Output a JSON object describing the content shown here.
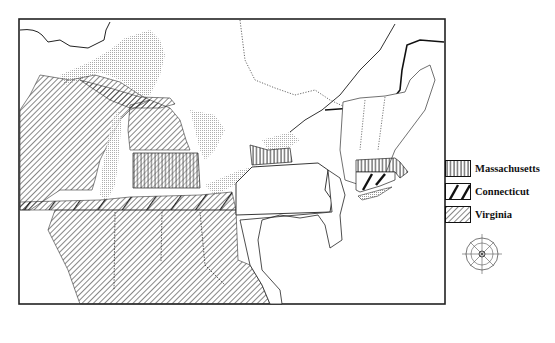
{
  "map": {
    "title": "",
    "region": "Great Lakes and Northeastern United States",
    "compass": {
      "visible": true,
      "position": [
        482,
        254
      ]
    }
  },
  "legend": {
    "items": [
      {
        "label": "Massachusetts",
        "pattern": "vertical-lines"
      },
      {
        "label": "Connecticut",
        "pattern": "wide-bold-diagonal"
      },
      {
        "label": "Virginia",
        "pattern": "fine-diagonal"
      }
    ]
  },
  "colors": {
    "ink": "#111111",
    "paper": "#ffffff",
    "water_shading": "#bdbdbd",
    "frame": "#222222"
  }
}
